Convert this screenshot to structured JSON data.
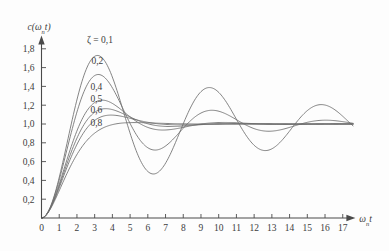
{
  "chart_data": {
    "type": "line",
    "title": "",
    "subtitle": "",
    "xlabel": "ωₙt",
    "xlabel_base": "ω",
    "xlabel_subscript": "n",
    "xlabel_tail": "t",
    "ylabel": "c(ωₙt)",
    "ylabel_prefix": "c(",
    "ylabel_base": "ω",
    "ylabel_subscript": "n",
    "ylabel_tail": "t)",
    "xlim": [
      0,
      17.6
    ],
    "ylim": [
      0,
      1.92
    ],
    "grid": false,
    "legend_position": "inline-curve-labels",
    "decimal_separator": ",",
    "xticks": [
      0,
      1,
      2,
      3,
      4,
      5,
      6,
      7,
      8,
      9,
      10,
      11,
      12,
      13,
      14,
      15,
      16,
      17
    ],
    "xtick_labels": [
      "0",
      "1",
      "2",
      "3",
      "4",
      "5",
      "6",
      "7",
      "8",
      "9",
      "10",
      "11",
      "12",
      "13",
      "14",
      "15",
      "16",
      "17"
    ],
    "yticks": [
      0.2,
      0.4,
      0.6,
      0.8,
      1.0,
      1.2,
      1.4,
      1.6,
      1.8
    ],
    "ytick_labels": [
      "0,2",
      "0,4",
      "0,6",
      "0,8",
      "1,0",
      "1,2",
      "1,4",
      "1,6",
      "1,8"
    ],
    "annotations": [
      {
        "text": "ζ = 0,1",
        "x": 3.3,
        "y": 1.86,
        "series": "0,1"
      },
      {
        "text": "0,2",
        "x": 3.15,
        "y": 1.64,
        "series": "0,2"
      },
      {
        "text": "0,4",
        "x": 3.1,
        "y": 1.36,
        "series": "0,4"
      },
      {
        "text": "0,5",
        "x": 3.1,
        "y": 1.23,
        "series": "0,5"
      },
      {
        "text": "0,6",
        "x": 3.1,
        "y": 1.12,
        "series": "0,6"
      },
      {
        "text": "0,8",
        "x": 3.1,
        "y": 0.98,
        "series": "0,8"
      }
    ],
    "series": [
      {
        "name": "0,1",
        "zeta": 0.1,
        "label": "ζ = 0,1",
        "color": "#6e6e6e",
        "peaks": [
          {
            "x": 3.2,
            "y": 1.73
          },
          {
            "x": 9.6,
            "y": 1.4
          },
          {
            "x": 15.9,
            "y": 1.21
          }
        ],
        "troughs": [
          {
            "x": 6.4,
            "y": 0.48
          },
          {
            "x": 12.8,
            "y": 0.73
          }
        ],
        "x": [
          0,
          0.5,
          1,
          1.5,
          2,
          2.5,
          3,
          3.2,
          3.5,
          4,
          4.5,
          5,
          5.5,
          6,
          6.4,
          7,
          7.5,
          8,
          8.5,
          9,
          9.6,
          10,
          10.5,
          11,
          11.5,
          12,
          12.8,
          13.5,
          14,
          14.5,
          15,
          15.9,
          16.5,
          17,
          17.5
        ],
        "y": [
          0,
          0.116,
          0.421,
          0.81,
          1.173,
          1.452,
          1.637,
          1.73,
          1.688,
          1.597,
          1.42,
          1.197,
          0.96,
          0.74,
          0.48,
          0.558,
          0.582,
          0.688,
          0.846,
          1.03,
          1.4,
          1.357,
          1.4,
          1.37,
          1.28,
          1.15,
          0.73,
          0.79,
          0.832,
          0.906,
          0.993,
          1.21,
          1.175,
          1.13,
          1.09
        ]
      },
      {
        "name": "0,2",
        "zeta": 0.2,
        "label": "0,2",
        "color": "#6e6e6e",
        "peaks": [
          {
            "x": 3.2,
            "y": 1.53
          },
          {
            "x": 9.7,
            "y": 1.17
          }
        ],
        "troughs": [
          {
            "x": 6.4,
            "y": 0.74
          },
          {
            "x": 12.9,
            "y": 0.93
          }
        ],
        "x": [
          0,
          0.5,
          1,
          1.5,
          2,
          2.5,
          3,
          3.2,
          3.5,
          4,
          4.5,
          5,
          5.5,
          6,
          6.4,
          7,
          7.5,
          8,
          8.5,
          9,
          9.7,
          10.5,
          11,
          11.5,
          12,
          12.9,
          13.5,
          14,
          15,
          16,
          17,
          17.5
        ],
        "y": [
          0,
          0.114,
          0.407,
          0.772,
          1.1,
          1.337,
          1.478,
          1.53,
          1.48,
          1.375,
          1.225,
          1.063,
          0.912,
          0.8,
          0.74,
          0.762,
          0.81,
          0.885,
          0.97,
          1.05,
          1.17,
          1.14,
          1.11,
          1.065,
          1.02,
          0.93,
          0.945,
          0.962,
          1.01,
          1.055,
          1.04,
          1.025
        ]
      },
      {
        "name": "0,4",
        "zeta": 0.4,
        "label": "0,4",
        "color": "#6e6e6e",
        "peaks": [
          {
            "x": 3.5,
            "y": 1.25
          }
        ],
        "troughs": [
          {
            "x": 6.9,
            "y": 0.93
          }
        ],
        "x": [
          0,
          0.5,
          1,
          1.5,
          2,
          2.5,
          3,
          3.5,
          4,
          4.5,
          5,
          5.5,
          6,
          6.9,
          7.5,
          8,
          9,
          10,
          11,
          12,
          13,
          14,
          15,
          16,
          17,
          17.5
        ],
        "y": [
          0,
          0.104,
          0.356,
          0.657,
          0.917,
          1.102,
          1.2,
          1.25,
          1.23,
          1.185,
          1.125,
          1.06,
          1.008,
          0.93,
          0.945,
          0.962,
          0.996,
          1.015,
          1.012,
          1.005,
          0.998,
          1.0,
          1.002,
          1.002,
          1.0,
          1.0
        ]
      },
      {
        "name": "0,5",
        "zeta": 0.5,
        "label": "0,5",
        "color": "#6e6e6e",
        "peaks": [
          {
            "x": 3.6,
            "y": 1.17
          }
        ],
        "troughs": [
          {
            "x": 7.3,
            "y": 0.96
          }
        ],
        "x": [
          0,
          0.5,
          1,
          1.5,
          2,
          2.5,
          3,
          3.6,
          4,
          4.5,
          5,
          5.5,
          6,
          7.3,
          8,
          9,
          10,
          11,
          12,
          13,
          14,
          15,
          16,
          17,
          17.5
        ],
        "y": [
          0,
          0.098,
          0.33,
          0.605,
          0.843,
          1.007,
          1.105,
          1.17,
          1.16,
          1.138,
          1.1,
          1.06,
          1.025,
          0.963,
          0.975,
          0.995,
          1.008,
          1.008,
          1.003,
          1.0,
          1.0,
          1.0,
          1.0,
          1.0,
          1.0
        ]
      },
      {
        "name": "0,6",
        "zeta": 0.6,
        "label": "0,6",
        "color": "#6e6e6e",
        "peaks": [
          {
            "x": 3.9,
            "y": 1.1
          }
        ],
        "troughs": [
          {
            "x": 7.8,
            "y": 0.98
          }
        ],
        "x": [
          0,
          0.5,
          1,
          1.5,
          2,
          2.5,
          3,
          3.9,
          4.5,
          5,
          5.5,
          6,
          7,
          7.8,
          9,
          10,
          11,
          12,
          13,
          14,
          15,
          16,
          17,
          17.5
        ],
        "y": [
          0,
          0.092,
          0.303,
          0.553,
          0.77,
          0.925,
          1.02,
          1.095,
          1.08,
          1.058,
          1.035,
          1.018,
          0.995,
          0.982,
          0.993,
          1.002,
          1.005,
          1.003,
          1.0,
          1.0,
          1.0,
          1.0,
          1.0,
          1.0
        ]
      },
      {
        "name": "0,8",
        "zeta": 0.8,
        "label": "0,8",
        "color": "#6e6e6e",
        "peaks": [
          {
            "x": 5.3,
            "y": 1.015
          }
        ],
        "troughs": [],
        "x": [
          0,
          0.5,
          1,
          1.5,
          2,
          2.5,
          3,
          3.5,
          4,
          4.5,
          5,
          5.3,
          6,
          7,
          8,
          9,
          10,
          11,
          12,
          13,
          14,
          15,
          16,
          17,
          17.5
        ],
        "y": [
          0,
          0.078,
          0.254,
          0.457,
          0.64,
          0.782,
          0.88,
          0.942,
          0.98,
          1.0,
          1.01,
          1.015,
          1.013,
          1.008,
          1.003,
          1.001,
          1.0,
          1.0,
          1.0,
          1.0,
          1.0,
          1.0,
          1.0,
          1.0,
          1.0
        ]
      }
    ]
  }
}
